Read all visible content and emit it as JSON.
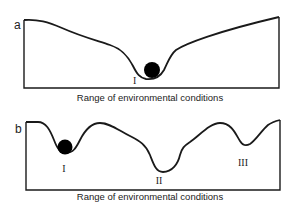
{
  "panels": [
    {
      "id": "a",
      "label": "a",
      "axis_caption": "Range of environmental conditions",
      "wells": [
        {
          "label": "I",
          "has_ball": true
        }
      ]
    },
    {
      "id": "b",
      "label": "b",
      "axis_caption": "Range of environmental conditions",
      "wells": [
        {
          "label": "I",
          "has_ball": true
        },
        {
          "label": "II",
          "has_ball": false
        },
        {
          "label": "III",
          "has_ball": false
        }
      ]
    }
  ],
  "colors": {
    "line": "#1a1a1a",
    "ball": "#000000",
    "background": "#ffffff"
  }
}
